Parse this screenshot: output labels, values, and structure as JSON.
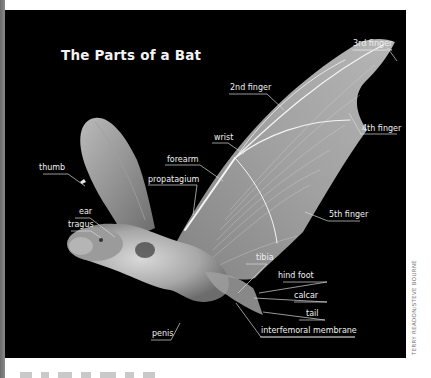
{
  "figure": {
    "title": "The Parts of a Bat",
    "credit": "TERRY READON/STEVE BOURNE",
    "colors": {
      "background": "#000000",
      "label_text": "#f0f0f0",
      "leader_line": "#d8d8d8",
      "page": "#ffffff"
    },
    "labels": {
      "third_finger": "3rd finger",
      "second_finger": "2nd finger",
      "fourth_finger": "4th finger",
      "wrist": "wrist",
      "forearm": "forearm",
      "thumb": "thumb",
      "propatagium": "propatagium",
      "fifth_finger": "5th finger",
      "ear": "ear",
      "tragus": "tragus",
      "tibia": "tibia",
      "hind_foot": "hind foot",
      "calcar": "calcar",
      "tail": "tail",
      "penis": "penis",
      "interfemoral_membrane": "interfemoral membrane"
    }
  }
}
